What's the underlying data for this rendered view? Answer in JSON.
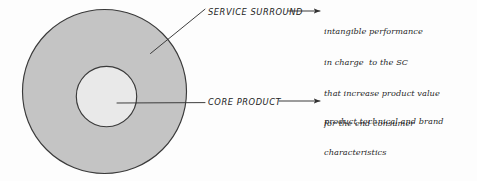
{
  "diagram": {
    "background_color": "#fdfdfd",
    "stroke_color": "#3a3a3a",
    "shapes": {
      "outer_ring": {
        "name": "SERVICE SURROUND",
        "fill_color": "#c4c4c4",
        "center_x": 104.5,
        "center_y": 91.5,
        "radius": 82.5
      },
      "inner_circle": {
        "name": "CORE PRODUCT",
        "fill_color": "#e9e9e9",
        "center_x": 106.5,
        "center_y": 96.5,
        "radius": 30.5
      }
    },
    "callouts": [
      {
        "id": "service-surround",
        "label": "SERVICE SURROUND",
        "description_lines": [
          "intangible performance",
          "in charge  to the SC",
          "that increase product value",
          "for the end consumer"
        ],
        "leader_from_x": 151,
        "leader_from_y": 53,
        "leader_to_x": 205,
        "leader_to_y": 9,
        "arrow_from_x": 288,
        "arrow_to_x": 321,
        "arrow_y": 11
      },
      {
        "id": "core-product",
        "label": "CORE PRODUCT",
        "description_lines": [
          "product technical and brand",
          "characteristics"
        ],
        "leader_from_x": 117,
        "leader_from_y": 103,
        "leader_to_x": 205,
        "leader_to_y": 103,
        "arrow_from_x": 280,
        "arrow_to_x": 321,
        "arrow_y": 101
      }
    ]
  }
}
